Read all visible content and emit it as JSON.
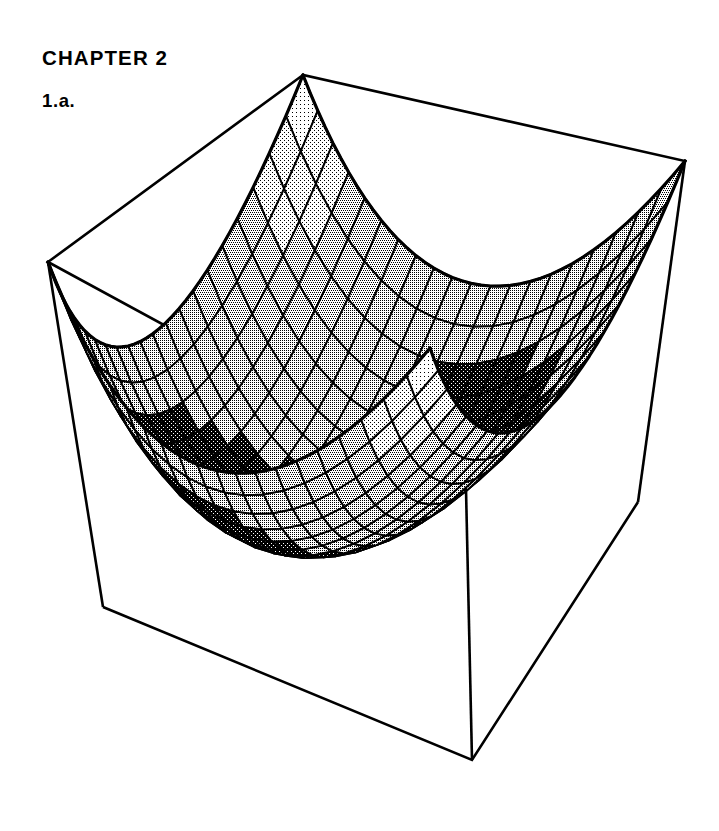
{
  "page": {
    "background_color": "#ffffff",
    "ink_color": "#000000",
    "width": 719,
    "height": 831
  },
  "header": {
    "chapter": "CHAPTER 2",
    "problem": "1.a."
  },
  "figure": {
    "name": "paraboloid-surface-plot",
    "line_color": "#000000",
    "mesh_fill_light": "#b9b9b9",
    "mesh_fill_dark": "#111111"
  },
  "chart_data": {
    "type": "surface",
    "title": "",
    "subtitle": "",
    "xlabel": "",
    "ylabel": "",
    "zlabel": "",
    "function": "z = x^2 + y^2",
    "surface_style": "wireframe-mesh-shaded",
    "grid": true,
    "legend": false,
    "legend_position": "none",
    "xlim": [
      -1,
      1
    ],
    "ylim": [
      -1,
      1
    ],
    "zlim": [
      0,
      2
    ],
    "x_ticks": [],
    "y_ticks": [],
    "z_ticks": [],
    "mesh_divisions_u": 20,
    "mesh_divisions_v": 20,
    "view": {
      "azimuth_deg": 45,
      "elevation_deg": 28
    },
    "box": {
      "visible": true,
      "top_face_corners": [
        {
          "label": "back",
          "x": 303,
          "y": 75
        },
        {
          "label": "right",
          "x": 685,
          "y": 161
        },
        {
          "label": "front",
          "x": 466,
          "y": 489
        },
        {
          "label": "left",
          "x": 48,
          "y": 262
        }
      ],
      "bottom_face_corners": [
        {
          "label": "right",
          "x": 638,
          "y": 502
        },
        {
          "label": "front",
          "x": 472,
          "y": 760
        },
        {
          "label": "left",
          "x": 103,
          "y": 607
        }
      ]
    },
    "annotations": []
  }
}
